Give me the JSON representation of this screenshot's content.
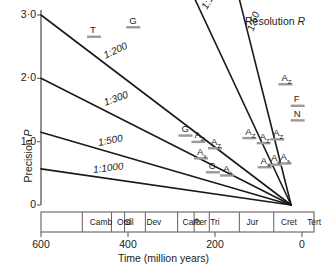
{
  "chart_data": {
    "type": "line",
    "title": "",
    "xlabel": "Time (million years)",
    "ylabel": "Precision P",
    "xlim": [
      600,
      0
    ],
    "ylim": [
      0,
      3.0
    ],
    "grid": false,
    "legend_position": "inline-labels",
    "annotation": "Resolution R",
    "xticks": [
      "600",
      "400",
      "200",
      "0"
    ],
    "xtick_values": [
      600,
      400,
      200,
      0
    ],
    "yticks": [
      "3·0",
      "2·0",
      "1·0",
      "0"
    ],
    "ytick_values": [
      3.0,
      2.0,
      1.0,
      0
    ],
    "series": [
      {
        "name": "1:50",
        "label": "1:50",
        "x": [
          155,
          25
        ],
        "y": [
          3.55,
          0.0
        ]
      },
      {
        "name": "1:100",
        "label": "1:100",
        "x": [
          270,
          25
        ],
        "y": [
          3.6,
          0.0
        ]
      },
      {
        "name": "1:200",
        "label": "1:200",
        "x": [
          600,
          25
        ],
        "y": [
          3.0,
          0.0
        ]
      },
      {
        "name": "1:300",
        "label": "1:300",
        "x": [
          600,
          25
        ],
        "y": [
          2.0,
          0.0
        ]
      },
      {
        "name": "1:500",
        "label": "1:500",
        "x": [
          600,
          25
        ],
        "y": [
          1.15,
          0.0
        ]
      },
      {
        "name": "1:1000",
        "label": "1:1000",
        "x": [
          600,
          25
        ],
        "y": [
          0.57,
          0.0
        ]
      }
    ],
    "points": [
      {
        "label": "T",
        "sub": "",
        "x": 478,
        "y": 2.68
      },
      {
        "label": "G",
        "sub": "",
        "x": 388,
        "y": 2.83
      },
      {
        "label": "G",
        "sub": "",
        "x": 268,
        "y": 1.12
      },
      {
        "label": "A",
        "sub": "Z",
        "x": 238,
        "y": 1.02
      },
      {
        "label": "A",
        "sub": "Z",
        "x": 200,
        "y": 0.92
      },
      {
        "label": "A",
        "sub": "s",
        "x": 232,
        "y": 0.76
      },
      {
        "label": "C",
        "sub": "",
        "x": 205,
        "y": 0.54
      },
      {
        "label": "A",
        "sub": "s",
        "x": 172,
        "y": 0.49
      },
      {
        "label": "A",
        "sub": "Z",
        "x": 121,
        "y": 1.08
      },
      {
        "label": "A",
        "sub": "Z",
        "x": 88,
        "y": 1.0
      },
      {
        "label": "A",
        "sub": "Z",
        "x": 57,
        "y": 1.06
      },
      {
        "label": "A",
        "sub": "Z",
        "x": 38,
        "y": 1.93
      },
      {
        "label": "A",
        "sub": "s",
        "x": 86,
        "y": 0.62
      },
      {
        "label": "A",
        "sub": "s",
        "x": 62,
        "y": 0.66
      },
      {
        "label": "A",
        "sub": "s",
        "x": 40,
        "y": 0.68
      },
      {
        "label": "F",
        "sub": "",
        "x": 10,
        "y": 1.59
      },
      {
        "label": "N",
        "sub": "",
        "x": 10,
        "y": 1.36
      }
    ],
    "periods": [
      {
        "name": "Camb",
        "start": 600,
        "end": 505
      },
      {
        "name": "Ord",
        "start": 505,
        "end": 438
      },
      {
        "name": "Sil",
        "start": 438,
        "end": 408
      },
      {
        "name": "Dev",
        "start": 408,
        "end": 360
      },
      {
        "name": "Carb",
        "start": 360,
        "end": 286
      },
      {
        "name": "Per",
        "start": 286,
        "end": 248
      },
      {
        "name": "Tri",
        "start": 248,
        "end": 213
      },
      {
        "name": "Jur",
        "start": 213,
        "end": 144
      },
      {
        "name": "Cret",
        "start": 144,
        "end": 65
      },
      {
        "name": "Tert",
        "start": 65,
        "end": 0
      }
    ],
    "colors": {
      "line": "#1a1a1a",
      "axis": "#6e6e6e",
      "errorbar": "#9a9a9a",
      "text": "#1a1a1a",
      "background": "#ffffff"
    }
  }
}
